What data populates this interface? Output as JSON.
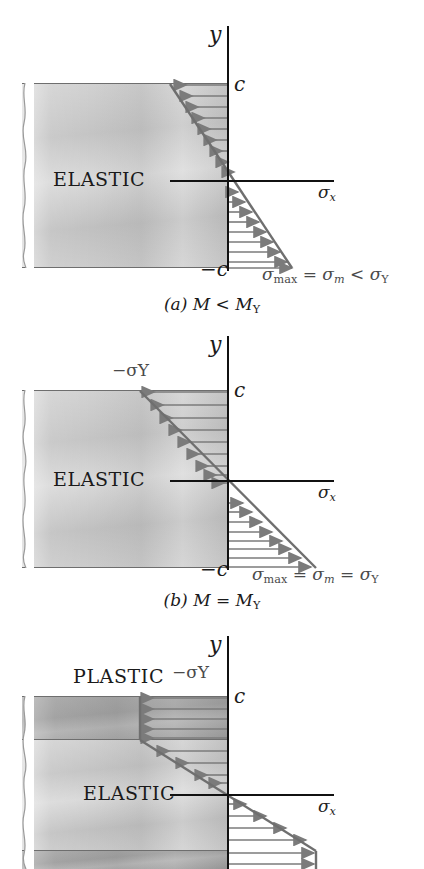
{
  "figure": {
    "type": "engineering-diagram",
    "axis_labels": {
      "y": "y",
      "x": "σ",
      "x_sub": "x"
    },
    "colors": {
      "arrow": "#7b7b7b",
      "axis": "#111111",
      "beam_light": "#cfcfcf",
      "beam_dark": "#a5a5a5",
      "label_gray": "#4a4a4a"
    }
  },
  "panels": [
    {
      "id": "a",
      "caption_prefix": "(a)",
      "caption_body": "M < M",
      "caption_sub": "Y",
      "caption_full": "(a) M < M_Y",
      "region_label": "ELASTIC",
      "plastic_label": "",
      "top_fiber_label": "c",
      "bottom_fiber_label": "−c",
      "yield_label": "",
      "stress_label_parts": [
        "σ",
        "max",
        " = ",
        "σ",
        "m",
        " < ",
        "σ",
        "Y"
      ],
      "stress_label_full": "σmax = σm < σY",
      "state": "fully-elastic"
    },
    {
      "id": "b",
      "caption_prefix": "(b)",
      "caption_body": "M = M",
      "caption_sub": "Y",
      "caption_full": "(b) M = M_Y",
      "region_label": "ELASTIC",
      "plastic_label": "",
      "top_fiber_label": "c",
      "bottom_fiber_label": "−c",
      "yield_label": "−σY",
      "stress_label_parts": [
        "σ",
        "max",
        " = ",
        "σ",
        "m",
        " = ",
        "σ",
        "Y"
      ],
      "stress_label_full": "σmax = σm = σY",
      "state": "yield-onset"
    },
    {
      "id": "c",
      "caption_prefix": "",
      "caption_body": "",
      "caption_sub": "",
      "caption_full": "",
      "region_label": "ELASTIC",
      "plastic_label": "PLASTIC",
      "top_fiber_label": "c",
      "bottom_fiber_label": "",
      "yield_label": "−σY",
      "stress_label_parts": [],
      "stress_label_full": "",
      "state": "partially-plastic"
    }
  ],
  "glyphs": {
    "sigma": "σ",
    "minus": "−",
    "less_than": "<",
    "equals": "="
  }
}
